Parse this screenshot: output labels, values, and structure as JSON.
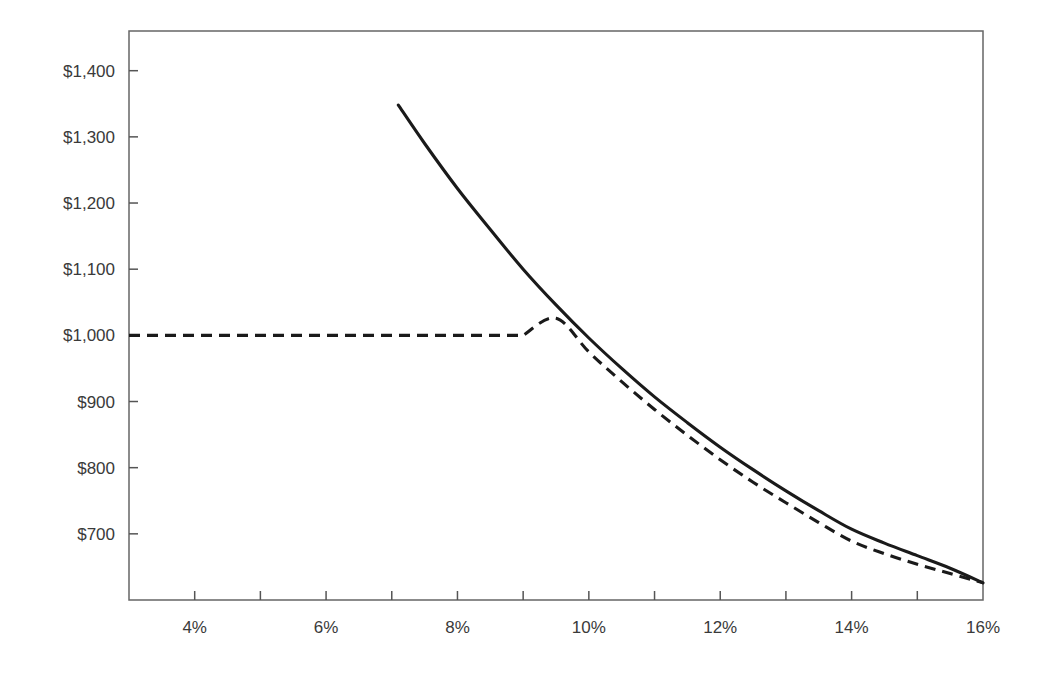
{
  "chart_data": {
    "type": "line",
    "title": "",
    "subtitle": "",
    "xlabel": "",
    "ylabel": "",
    "xlim": [
      3,
      16
    ],
    "ylim": [
      600,
      1460
    ],
    "grid": false,
    "legend": "none",
    "x_tick_labels": [
      "4%",
      "6%",
      "8%",
      "10%",
      "12%",
      "14%",
      "16%"
    ],
    "x_tick_values": [
      4,
      6,
      8,
      10,
      12,
      14,
      16
    ],
    "x_minor_tick_values": [
      3,
      4,
      5,
      6,
      7,
      8,
      9,
      10,
      11,
      12,
      13,
      14,
      15,
      16
    ],
    "y_tick_labels": [
      "$1,400",
      "$1,300",
      "$1,200",
      "$1,100",
      "$1,000",
      "$900",
      "$800",
      "$700"
    ],
    "y_tick_values": [
      1400,
      1300,
      1200,
      1100,
      1000,
      900,
      800,
      700
    ],
    "series": [
      {
        "name": "solid-curve",
        "style": "solid",
        "color": "#1a1a1a",
        "x": [
          7.1,
          7.5,
          8.0,
          8.5,
          9.0,
          9.5,
          10.0,
          10.5,
          11.0,
          11.5,
          12.0,
          12.5,
          13.0,
          13.5,
          14.0,
          14.5,
          15.0,
          15.5,
          16.0
        ],
        "y": [
          1348,
          1290,
          1222,
          1160,
          1100,
          1046,
          996,
          950,
          907,
          868,
          831,
          797,
          765,
          735,
          707,
          686,
          667,
          648,
          626
        ]
      },
      {
        "name": "dashed-curve",
        "style": "dashed",
        "color": "#1a1a1a",
        "x": [
          3.0,
          4.0,
          5.0,
          6.0,
          7.0,
          8.0,
          9.0,
          9.5,
          10.0,
          10.5,
          11.0,
          11.5,
          12.0,
          12.5,
          13.0,
          13.5,
          14.0,
          14.5,
          15.0,
          15.5,
          16.0
        ],
        "y": [
          1000,
          1000,
          1000,
          1000,
          1000,
          1000,
          1000,
          1026,
          975,
          930,
          888,
          849,
          812,
          778,
          747,
          717,
          689,
          670,
          654,
          640,
          626
        ]
      }
    ]
  }
}
